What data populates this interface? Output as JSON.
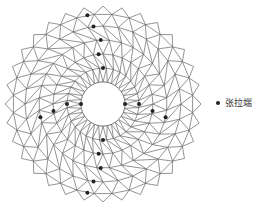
{
  "diagram": {
    "center": [
      103,
      104
    ],
    "rings": [
      22,
      36,
      50,
      64,
      78,
      90
    ],
    "segments": 16,
    "outer_spike_radius": 98,
    "line_color": "#666666",
    "node_color": "#222222",
    "markers": [
      {
        "r": 22,
        "angle": 0
      },
      {
        "r": 22,
        "angle": 180
      },
      {
        "r": 36,
        "angle": 90
      },
      {
        "r": 36,
        "angle": 270
      },
      {
        "r": 50,
        "angle": 95
      },
      {
        "r": 50,
        "angle": 265
      },
      {
        "r": 64,
        "angle": 92
      },
      {
        "r": 64,
        "angle": 268
      },
      {
        "r": 78,
        "angle": 97
      },
      {
        "r": 78,
        "angle": 263
      },
      {
        "r": 36,
        "angle": 0
      },
      {
        "r": 50,
        "angle": 8
      },
      {
        "r": 64,
        "angle": 12
      },
      {
        "r": 36,
        "angle": 180
      },
      {
        "r": 50,
        "angle": 172
      },
      {
        "r": 64,
        "angle": 168
      },
      {
        "r": 90,
        "angle": 100
      },
      {
        "r": 90,
        "angle": 260
      }
    ]
  },
  "legend": {
    "label": "张拉端",
    "symbol": "filled-circle"
  }
}
